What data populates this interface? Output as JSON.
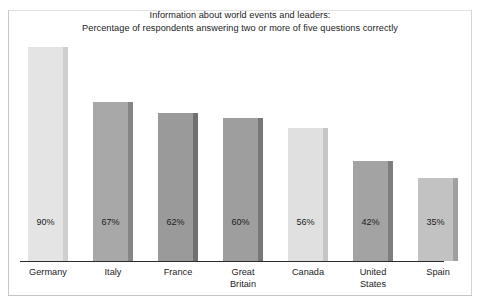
{
  "title": {
    "line1": "Information about world events and leaders:",
    "line2": "Percentage of respondents answering two or more of five questions correctly"
  },
  "chart_data": {
    "type": "bar",
    "title": "Information about world events and leaders: Percentage of respondents answering two or more of five questions correctly",
    "xlabel": "",
    "ylabel": "",
    "ylim": [
      0,
      100
    ],
    "grid": false,
    "legend": null,
    "categories": [
      "Germany",
      "Italy",
      "France",
      "Great Britain",
      "Canada",
      "United States",
      "Spain"
    ],
    "values": [
      90,
      67,
      62,
      60,
      56,
      42,
      35
    ],
    "value_labels": [
      "90%",
      "67%",
      "62%",
      "60%",
      "56%",
      "42%",
      "35%"
    ],
    "bars": [
      {
        "category": "Germany",
        "label_line1": "Germany",
        "label_line2": "",
        "value": 90,
        "value_label": "90%",
        "face_color": "#e4e4e4",
        "side_color": "#cfcfcf"
      },
      {
        "category": "Italy",
        "label_line1": "Italy",
        "label_line2": "",
        "value": 67,
        "value_label": "67%",
        "face_color": "#a8a8a8",
        "side_color": "#868686"
      },
      {
        "category": "France",
        "label_line1": "France",
        "label_line2": "",
        "value": 62,
        "value_label": "62%",
        "face_color": "#9a9a9a",
        "side_color": "#707070"
      },
      {
        "category": "Great Britain",
        "label_line1": "Great",
        "label_line2": "Britain",
        "value": 60,
        "value_label": "60%",
        "face_color": "#9e9e9e",
        "side_color": "#777777"
      },
      {
        "category": "Canada",
        "label_line1": "Canada",
        "label_line2": "",
        "value": 56,
        "value_label": "56%",
        "face_color": "#e0e0e0",
        "side_color": "#c6c6c6"
      },
      {
        "category": "United States",
        "label_line1": "United",
        "label_line2": "States",
        "value": 42,
        "value_label": "42%",
        "face_color": "#a3a3a3",
        "side_color": "#7e7e7e"
      },
      {
        "category": "Spain",
        "label_line1": "Spain",
        "label_line2": "",
        "value": 35,
        "value_label": "35%",
        "face_color": "#c2c2c2",
        "side_color": "#a0a0a0"
      }
    ]
  }
}
